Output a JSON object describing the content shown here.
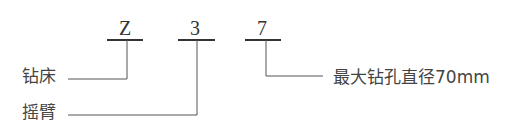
{
  "diagram": {
    "type": "model-code-breakdown",
    "code_chars": [
      {
        "char": "Z",
        "meaning": "钻床"
      },
      {
        "char": "3",
        "meaning": "摇臂"
      },
      {
        "char": "7",
        "meaning": "最大钻孔直径70mm"
      }
    ],
    "labels": {
      "left_1": "钻床",
      "left_2": "摇臂",
      "right_1": "最大钻孔直径70mm"
    },
    "colors": {
      "text": "#444444",
      "line": "#555555",
      "background": "#ffffff"
    }
  }
}
